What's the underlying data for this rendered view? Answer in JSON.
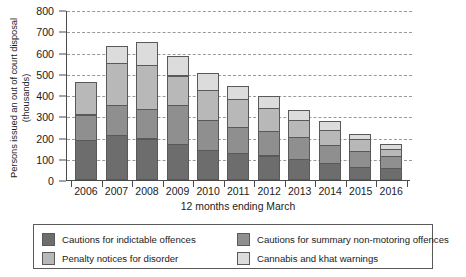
{
  "chart_data": {
    "type": "bar",
    "stacked": true,
    "title": "",
    "xlabel": "12 months ending March",
    "ylabel": "Persons issued an out of court disposal (thousands)",
    "ylabel_lines": [
      "Persons issued an out of court disposal",
      "(thousands)"
    ],
    "ylim": [
      0,
      800
    ],
    "yticks": [
      0,
      100,
      200,
      300,
      400,
      500,
      600,
      700,
      800
    ],
    "grid": true,
    "legend_position": "bottom",
    "categories": [
      "2006",
      "2007",
      "2008",
      "2009",
      "2010",
      "2011",
      "2012",
      "2013",
      "2014",
      "2015",
      "2016"
    ],
    "series": [
      {
        "name": "Cautions for indictable offences",
        "color": "#6d6d6d",
        "values": [
          190,
          210,
          195,
          170,
          140,
          125,
          115,
          100,
          80,
          60,
          55
        ]
      },
      {
        "name": "Cautions for summary non-motoring offences",
        "color": "#8f8f8f",
        "values": [
          122,
          145,
          145,
          185,
          145,
          130,
          120,
          105,
          90,
          80,
          60
        ]
      },
      {
        "name": "Penalty notices for disorder",
        "color": "#b8b8b8",
        "values": [
          158,
          205,
          210,
          145,
          145,
          135,
          110,
          85,
          75,
          60,
          40
        ]
      },
      {
        "name": "Cannabis and khat warnings",
        "color": "#dcdcdc",
        "values": [
          0,
          85,
          110,
          95,
          85,
          65,
          65,
          50,
          45,
          30,
          25
        ]
      }
    ],
    "totals": [
      470,
      645,
      660,
      595,
      515,
      455,
      410,
      340,
      290,
      230,
      180
    ]
  },
  "legend": {
    "items": [
      {
        "label": "Cautions for indictable offences",
        "color": "#6d6d6d"
      },
      {
        "label": "Cautions for summary non-motoring offences",
        "color": "#8f8f8f"
      },
      {
        "label": "Penalty notices for disorder",
        "color": "#b8b8b8"
      },
      {
        "label": "Cannabis and khat warnings",
        "color": "#dcdcdc"
      }
    ]
  }
}
